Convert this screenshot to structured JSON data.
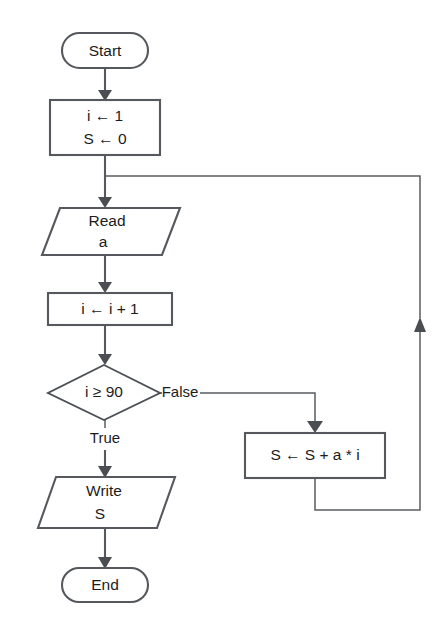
{
  "diagram": {
    "type": "flowchart",
    "colors": {
      "background": "#ffffff",
      "shape_stroke": "#55585c",
      "shape_fill": "#ffffff",
      "text": "#1c1c1c",
      "arrow": "#4a4d51"
    },
    "nodes": [
      {
        "id": "start",
        "shape": "terminator",
        "label": "Start",
        "lines": [
          "Start"
        ]
      },
      {
        "id": "init",
        "shape": "process",
        "label": "i ← 1 / S ← 0",
        "lines": [
          "i ← 1",
          "S ← 0"
        ]
      },
      {
        "id": "read",
        "shape": "input-output",
        "label": "Read a",
        "lines": [
          "Read",
          "a"
        ]
      },
      {
        "id": "increment",
        "shape": "process",
        "label": "i ← i + 1",
        "lines": [
          "i ← i + 1"
        ]
      },
      {
        "id": "decision",
        "shape": "decision",
        "label": "i ≥ 90",
        "lines": [
          "i ≥ 90"
        ]
      },
      {
        "id": "accumulate",
        "shape": "process",
        "label": "S ← S + a * i",
        "lines": [
          "S ← S + a * i"
        ]
      },
      {
        "id": "write",
        "shape": "input-output",
        "label": "Write S",
        "lines": [
          "Write",
          "S"
        ]
      },
      {
        "id": "end",
        "shape": "terminator",
        "label": "End",
        "lines": [
          "End"
        ]
      }
    ],
    "edge_labels": [
      {
        "id": "false-branch",
        "text": "False",
        "from": "decision",
        "to": "accumulate"
      },
      {
        "id": "true-branch",
        "text": "True",
        "from": "decision",
        "to": "write"
      }
    ]
  }
}
